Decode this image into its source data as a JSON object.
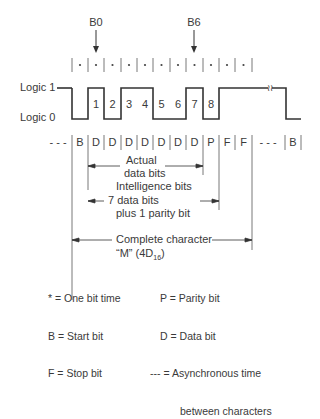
{
  "diagram": {
    "type": "asynchronous serial character timing diagram",
    "top_labels": {
      "b0": "B0",
      "b6": "B6"
    },
    "bit_time_marker": "*",
    "level_labels": {
      "logic1": "Logic 1",
      "logic0": "Logic 0"
    },
    "bit_numbers": [
      "1",
      "2",
      "3",
      "4",
      "5",
      "6",
      "7",
      "8"
    ],
    "waveform_levels": {
      "idle": 1,
      "bits": [
        {
          "name": "B",
          "level": 0
        },
        {
          "name": "1",
          "level": 1
        },
        {
          "name": "2",
          "level": 0
        },
        {
          "name": "3",
          "level": 1
        },
        {
          "name": "4",
          "level": 1
        },
        {
          "name": "5",
          "level": 0
        },
        {
          "name": "6",
          "level": 0
        },
        {
          "name": "7",
          "level": 1
        },
        {
          "name": "8",
          "level": 0
        },
        {
          "name": "F",
          "level": 1
        },
        {
          "name": "F",
          "level": 1
        }
      ],
      "after_break": 0
    },
    "bit_row": {
      "leading": "- - -",
      "cells": [
        "B",
        "D",
        "D",
        "D",
        "D",
        "D",
        "D",
        "D",
        "P",
        "F",
        "F"
      ],
      "gap": "- - -",
      "trailing": "B"
    },
    "brackets": {
      "actual": [
        "Actual",
        "data bits"
      ],
      "intelligence": [
        "Intelligence bits",
        "7 data bits",
        "plus 1 parity bit"
      ],
      "complete": [
        "Complete character",
        "“M” (4D",
        "16",
        ")"
      ]
    }
  },
  "legend": {
    "left": [
      "* = One bit time",
      "B = Start bit",
      "F = Stop bit"
    ],
    "right": [
      "P = Parity bit",
      "D = Data bit",
      "--- = Asynchronous time",
      "between characters"
    ]
  }
}
